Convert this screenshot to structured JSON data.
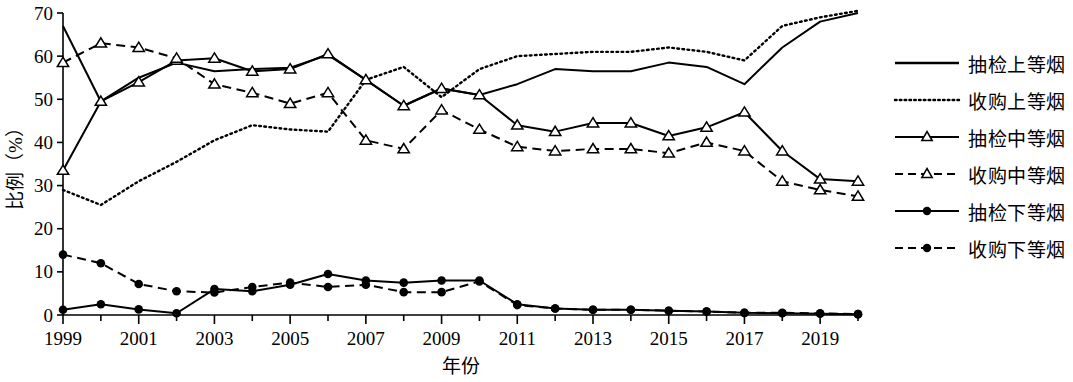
{
  "chart_data": {
    "type": "line",
    "title": "",
    "xlabel": "年份",
    "ylabel": "比例（%）",
    "x": [
      1999,
      2000,
      2001,
      2002,
      2003,
      2004,
      2005,
      2006,
      2007,
      2008,
      2009,
      2010,
      2011,
      2012,
      2013,
      2014,
      2015,
      2016,
      2017,
      2018,
      2019,
      2020
    ],
    "xlim": [
      1999,
      2020
    ],
    "ylim": [
      0,
      70
    ],
    "yticks": [
      0,
      10,
      20,
      30,
      40,
      50,
      60,
      70
    ],
    "xticks_labeled": [
      1999,
      2001,
      2003,
      2005,
      2007,
      2009,
      2011,
      2013,
      2015,
      2017,
      2019
    ],
    "grid": false,
    "legend_position": "right",
    "series": [
      {
        "name": "抽检上等烟",
        "style": "solid",
        "marker": "none",
        "color": "#000000",
        "values": [
          67.0,
          49.5,
          55.0,
          58.5,
          56.5,
          57.0,
          57.3,
          60.3,
          54.5,
          48.5,
          52.5,
          51.0,
          53.5,
          57.0,
          56.5,
          56.5,
          58.5,
          57.5,
          53.5,
          62.0,
          68.0,
          70.0
        ]
      },
      {
        "name": "收购上等烟",
        "style": "dotted",
        "marker": "none",
        "color": "#000000",
        "values": [
          29.0,
          25.5,
          31.0,
          35.5,
          40.5,
          44.0,
          43.0,
          42.5,
          54.5,
          57.5,
          50.5,
          57.0,
          60.0,
          60.5,
          61.0,
          61.0,
          62.0,
          61.0,
          59.0,
          67.0,
          69.0,
          70.5
        ]
      },
      {
        "name": "抽检中等烟",
        "style": "solid",
        "marker": "triangle",
        "color": "#000000",
        "values": [
          33.5,
          49.5,
          54.0,
          59.0,
          59.5,
          56.5,
          57.0,
          60.5,
          54.5,
          48.5,
          52.5,
          51.0,
          44.0,
          42.5,
          44.5,
          44.5,
          41.5,
          43.5,
          47.0,
          38.0,
          31.5,
          31.0
        ]
      },
      {
        "name": "收购中等烟",
        "style": "dashed",
        "marker": "triangle",
        "color": "#000000",
        "values": [
          58.5,
          63.0,
          62.0,
          59.5,
          53.5,
          51.5,
          49.0,
          51.5,
          40.5,
          38.5,
          47.5,
          43.0,
          39.0,
          38.0,
          38.5,
          38.5,
          37.5,
          40.0,
          38.0,
          31.0,
          29.0,
          27.5
        ]
      },
      {
        "name": "抽检下等烟",
        "style": "solid",
        "marker": "circle",
        "color": "#000000",
        "values": [
          1.2,
          2.5,
          1.3,
          0.4,
          6.0,
          5.5,
          7.0,
          9.5,
          8.0,
          7.5,
          8.0,
          8.0,
          2.5,
          1.5,
          1.2,
          1.2,
          1.0,
          0.8,
          0.5,
          0.4,
          0.3,
          0.2
        ]
      },
      {
        "name": "收购下等烟",
        "style": "dashed",
        "marker": "circle",
        "color": "#000000",
        "values": [
          14.0,
          12.0,
          7.2,
          5.5,
          5.2,
          6.5,
          7.5,
          6.5,
          7.0,
          5.3,
          5.3,
          7.8,
          2.3,
          1.5,
          1.2,
          1.2,
          1.0,
          0.8,
          0.5,
          0.5,
          0.4,
          0.2
        ]
      }
    ]
  },
  "legend": {
    "items": [
      {
        "label": "抽检上等烟"
      },
      {
        "label": "收购上等烟"
      },
      {
        "label": "抽检中等烟"
      },
      {
        "label": "收购中等烟"
      },
      {
        "label": "抽检下等烟"
      },
      {
        "label": "收购下等烟"
      }
    ]
  },
  "axes": {
    "y_label": "比例（%）",
    "x_label": "年份",
    "y_tick_labels": [
      "0",
      "10",
      "20",
      "30",
      "40",
      "50",
      "60",
      "70"
    ],
    "x_tick_labels": [
      "1999",
      "2001",
      "2003",
      "2005",
      "2007",
      "2009",
      "2011",
      "2013",
      "2015",
      "2017",
      "2019"
    ]
  }
}
